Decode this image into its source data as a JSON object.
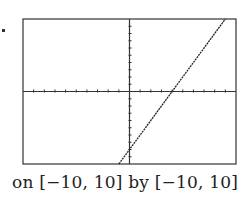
{
  "caption": "on [−10, 10] by [−10, 10]",
  "chart_data": {
    "type": "line",
    "title": "",
    "xlabel": "",
    "ylabel": "",
    "xlim": [
      -10,
      10
    ],
    "ylim": [
      -10,
      10
    ],
    "x_tick_spacing": 1,
    "y_tick_spacing": 1,
    "grid": false,
    "series": [
      {
        "name": "y = 2x - 8",
        "x": [
          -1,
          0,
          4,
          9
        ],
        "y": [
          -10,
          -8,
          0,
          10
        ]
      }
    ],
    "caption": "on [−10, 10] by [−10, 10]"
  },
  "colors": {
    "line": "#222222",
    "frame": "#333333",
    "background": "#ffffff"
  }
}
